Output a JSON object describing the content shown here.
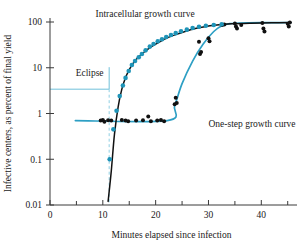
{
  "chart_data": {
    "type": "scatter",
    "title": "",
    "xlabel": "Minutes elapsed since infection",
    "ylabel": "Infective centers, as percent of final yield",
    "xlim": [
      0,
      46
    ],
    "ylim": [
      0.01,
      100
    ],
    "yscale": "log",
    "grid": false,
    "legend_position": "inline-annotations",
    "xticks": [
      0,
      10,
      20,
      30,
      40
    ],
    "xticklabels": [
      "0",
      "10",
      "20",
      "30",
      "40"
    ],
    "xminorticks": [
      5,
      15,
      25,
      35,
      45
    ],
    "yticks": [
      0.01,
      0.1,
      1,
      10,
      100
    ],
    "yticklabels": [
      "0.01",
      "0.1",
      "1",
      "10",
      "100"
    ],
    "annotations": [
      {
        "name": "intracellular-label",
        "text": "Intracellular growth curve",
        "x": 18,
        "y": 130
      },
      {
        "name": "one-step-label",
        "text": "One-step growth curve",
        "x": 30,
        "y": 0.62
      },
      {
        "name": "eclipse-label",
        "text": "Eclipse",
        "x": 7.5,
        "y": 5.5
      }
    ],
    "eclipse_marker": {
      "label": "Eclipse",
      "bracket_y": 3.4,
      "bracket_x_start": 0.5,
      "bracket_x_end": 11.2,
      "dashed_line_x": 11.2,
      "dashed_y_top": 3.4,
      "dashed_y_bottom": 0.011
    },
    "series": [
      {
        "name": "Intracellular growth curve",
        "color": "#1f94b8",
        "marker": "circle",
        "curve_color": "#111111",
        "points": [
          {
            "x": 11.3,
            "y": 0.1
          },
          {
            "x": 12.0,
            "y": 0.45
          },
          {
            "x": 12.6,
            "y": 1.15
          },
          {
            "x": 13.2,
            "y": 2.4
          },
          {
            "x": 13.8,
            "y": 4.1
          },
          {
            "x": 14.3,
            "y": 6.0
          },
          {
            "x": 14.9,
            "y": 8.5
          },
          {
            "x": 15.5,
            "y": 11.5
          },
          {
            "x": 16.1,
            "y": 14.0
          },
          {
            "x": 16.8,
            "y": 17.0
          },
          {
            "x": 17.4,
            "y": 20.0
          },
          {
            "x": 18.1,
            "y": 24.0
          },
          {
            "x": 18.9,
            "y": 29.0
          },
          {
            "x": 19.6,
            "y": 33.0
          },
          {
            "x": 20.4,
            "y": 38.0
          },
          {
            "x": 21.2,
            "y": 42.0
          },
          {
            "x": 22.0,
            "y": 47.0
          },
          {
            "x": 22.9,
            "y": 52.0
          },
          {
            "x": 23.8,
            "y": 57.0
          },
          {
            "x": 24.8,
            "y": 63.0
          },
          {
            "x": 25.9,
            "y": 68.0
          },
          {
            "x": 27.0,
            "y": 74.0
          },
          {
            "x": 28.2,
            "y": 79.0
          },
          {
            "x": 29.5,
            "y": 83.0
          },
          {
            "x": 31.0,
            "y": 86.0
          },
          {
            "x": 32.5,
            "y": 89.0
          }
        ],
        "fit_curve": [
          {
            "x": 11.0,
            "y": 0.012
          },
          {
            "x": 11.6,
            "y": 0.055
          },
          {
            "x": 12.2,
            "y": 0.35
          },
          {
            "x": 12.9,
            "y": 1.4
          },
          {
            "x": 13.6,
            "y": 3.4
          },
          {
            "x": 14.4,
            "y": 6.5
          },
          {
            "x": 15.3,
            "y": 10.5
          },
          {
            "x": 16.4,
            "y": 15.5
          },
          {
            "x": 17.6,
            "y": 21.0
          },
          {
            "x": 19.0,
            "y": 28.0
          },
          {
            "x": 20.6,
            "y": 36.0
          },
          {
            "x": 22.4,
            "y": 46.0
          },
          {
            "x": 24.4,
            "y": 56.0
          },
          {
            "x": 26.6,
            "y": 68.0
          },
          {
            "x": 29.0,
            "y": 78.0
          },
          {
            "x": 31.6,
            "y": 86.0
          },
          {
            "x": 34.4,
            "y": 91.0
          },
          {
            "x": 38.0,
            "y": 94.0
          },
          {
            "x": 42.0,
            "y": 96.0
          },
          {
            "x": 45.6,
            "y": 97.0
          }
        ]
      },
      {
        "name": "One-step growth curve",
        "color": "#111111",
        "marker": "circle",
        "curve_color": "#2d9fc4",
        "points": [
          {
            "x": 9.6,
            "y": 0.7
          },
          {
            "x": 10.0,
            "y": 0.72
          },
          {
            "x": 10.3,
            "y": 0.66
          },
          {
            "x": 11.0,
            "y": 0.71
          },
          {
            "x": 11.6,
            "y": 0.7
          },
          {
            "x": 13.6,
            "y": 0.72
          },
          {
            "x": 14.3,
            "y": 0.7
          },
          {
            "x": 14.8,
            "y": 0.68
          },
          {
            "x": 16.3,
            "y": 0.7
          },
          {
            "x": 17.6,
            "y": 0.71
          },
          {
            "x": 18.6,
            "y": 0.86
          },
          {
            "x": 19.1,
            "y": 0.68
          },
          {
            "x": 20.3,
            "y": 0.7
          },
          {
            "x": 21.0,
            "y": 0.72
          },
          {
            "x": 21.6,
            "y": 0.68
          },
          {
            "x": 23.6,
            "y": 1.6
          },
          {
            "x": 23.8,
            "y": 2.2
          },
          {
            "x": 24.0,
            "y": 1.7
          },
          {
            "x": 28.2,
            "y": 37.0
          },
          {
            "x": 28.4,
            "y": 20.0
          },
          {
            "x": 28.6,
            "y": 22.0
          },
          {
            "x": 30.0,
            "y": 44.0
          },
          {
            "x": 30.2,
            "y": 38.0
          },
          {
            "x": 32.6,
            "y": 86.0
          },
          {
            "x": 33.0,
            "y": 88.0
          },
          {
            "x": 35.0,
            "y": 93.0
          },
          {
            "x": 35.2,
            "y": 80.0
          },
          {
            "x": 35.4,
            "y": 72.0
          },
          {
            "x": 36.2,
            "y": 86.0
          },
          {
            "x": 40.2,
            "y": 95.0
          },
          {
            "x": 40.4,
            "y": 72.0
          },
          {
            "x": 40.6,
            "y": 62.0
          },
          {
            "x": 45.0,
            "y": 92.0
          },
          {
            "x": 45.2,
            "y": 80.0
          },
          {
            "x": 45.4,
            "y": 97.0
          }
        ],
        "fit_curve": [
          {
            "x": 4.8,
            "y": 0.7
          },
          {
            "x": 22.2,
            "y": 0.7
          },
          {
            "x": 23.6,
            "y": 1.5
          },
          {
            "x": 25.0,
            "y": 4.5
          },
          {
            "x": 27.0,
            "y": 14.0
          },
          {
            "x": 29.0,
            "y": 33.0
          },
          {
            "x": 31.0,
            "y": 62.0
          },
          {
            "x": 32.6,
            "y": 84.0
          },
          {
            "x": 34.0,
            "y": 92.0
          },
          {
            "x": 36.0,
            "y": 95.0
          },
          {
            "x": 40.0,
            "y": 96.5
          },
          {
            "x": 45.6,
            "y": 97.0
          }
        ]
      }
    ]
  }
}
